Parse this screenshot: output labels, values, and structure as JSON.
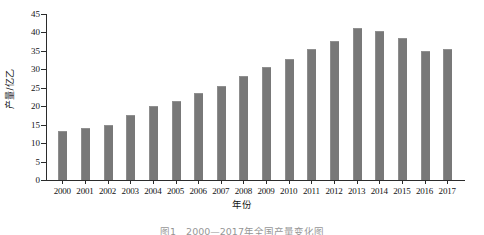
{
  "chart_data": {
    "type": "bar",
    "title": "",
    "xlabel": "年份",
    "ylabel": "产量/亿乙",
    "categories": [
      "2000",
      "2001",
      "2002",
      "2003",
      "2004",
      "2005",
      "2006",
      "2007",
      "2008",
      "2009",
      "2010",
      "2011",
      "2012",
      "2013",
      "2014",
      "2015",
      "2016",
      "2017"
    ],
    "values": [
      13.0,
      13.8,
      14.6,
      17.3,
      19.7,
      21.1,
      23.4,
      25.3,
      27.8,
      30.3,
      32.6,
      35.3,
      37.5,
      40.9,
      40.0,
      38.3,
      34.8,
      35.3
    ],
    "ylim": [
      0,
      45
    ],
    "yticks": [
      0,
      5,
      10,
      15,
      20,
      25,
      30,
      35,
      40,
      45
    ],
    "ytick_labels": [
      "0",
      "5",
      "10",
      "15",
      "20",
      "25",
      "30",
      "35",
      "40",
      "45"
    ],
    "grid": false,
    "legend": false,
    "bar_color": "#787878",
    "axis_color": "#2b2b2b"
  },
  "caption": {
    "text": "图1　2000—2017年全国产量变化图"
  }
}
